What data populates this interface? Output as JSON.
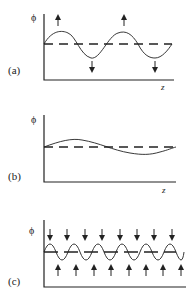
{
  "panels": [
    {
      "label": "(a)",
      "y_symbol": "ϕ",
      "x_symbol": "z",
      "description": "perturbation, moderate wavelength, arrows indicate growth"
    },
    {
      "label": "(b)",
      "y_symbol": "ϕ",
      "x_symbol": "z",
      "description": "long wavelength, small amplitude perturbation"
    },
    {
      "label": "(c)",
      "y_symbol": "ϕ",
      "x_symbol": "",
      "description": "short wavelength perturbation, arrows indicate decay"
    }
  ],
  "colors": {
    "line": "#222222",
    "background": "#ffffff"
  }
}
